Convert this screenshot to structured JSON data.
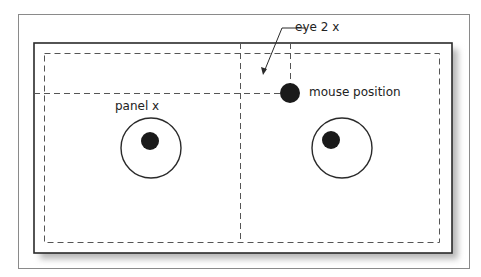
{
  "diagram": {
    "labels": {
      "eye_label": "eye 2 x",
      "mouse_label": "mouse position",
      "panel_label": "panel x"
    },
    "colors": {
      "stroke": "#2a2a2a",
      "outer_frame": "#8a8a8a",
      "dash": "#555555",
      "pupil": "#1a1a1a",
      "shadow": "#bdbdbd",
      "background": "#ffffff"
    },
    "eyes": [
      {
        "name": "left-eye",
        "cx": 151,
        "cy": 148,
        "r": 30,
        "pupil_cx": 150,
        "pupil_cy": 141,
        "pupil_r": 9
      },
      {
        "name": "right-eye",
        "cx": 342,
        "cy": 148,
        "r": 30,
        "pupil_cx": 331,
        "pupil_cy": 140,
        "pupil_r": 9
      }
    ],
    "mouse": {
      "cx": 290,
      "cy": 93,
      "r": 10
    }
  }
}
